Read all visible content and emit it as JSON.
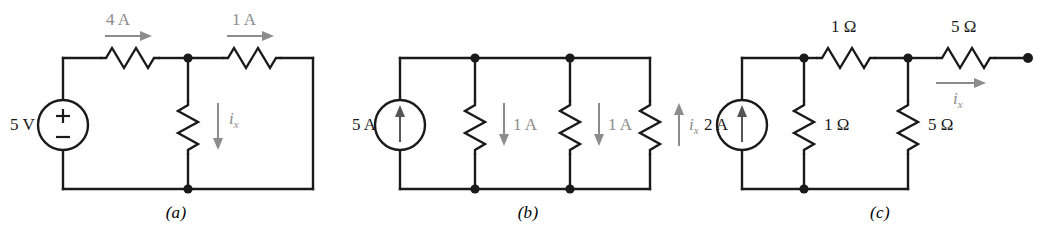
{
  "figure": {
    "background_color": "#ffffff",
    "wire_color": "#1a1a1a",
    "annotation_color": "#8c8c8c",
    "text_color": "#1a1a1a"
  },
  "panels": [
    {
      "caption": "(a)",
      "source": {
        "type": "voltage-source",
        "label": "5 V",
        "plus_sign": "+",
        "minus_sign": "−"
      },
      "resistors": [
        {
          "name": "top-left-resistor",
          "orientation": "horizontal",
          "label": ""
        },
        {
          "name": "top-right-resistor",
          "orientation": "horizontal",
          "label": ""
        },
        {
          "name": "middle-vertical-resistor",
          "orientation": "vertical",
          "label": ""
        }
      ],
      "current_annotations": [
        {
          "name": "current-4a",
          "text": "4 A",
          "direction": "right"
        },
        {
          "name": "current-1a",
          "text": "1 A",
          "direction": "right"
        },
        {
          "name": "current-ix",
          "text": "i",
          "subscript": "x",
          "direction": "down"
        }
      ]
    },
    {
      "caption": "(b)",
      "source": {
        "type": "current-source",
        "label": "5 A",
        "direction": "up"
      },
      "resistors": [
        {
          "name": "left-vertical-resistor",
          "orientation": "vertical",
          "label": ""
        },
        {
          "name": "middle-vertical-resistor",
          "orientation": "vertical",
          "label": ""
        },
        {
          "name": "right-vertical-resistor",
          "orientation": "vertical",
          "label": ""
        }
      ],
      "current_annotations": [
        {
          "name": "current-1a-left",
          "text": "1 A",
          "direction": "down"
        },
        {
          "name": "current-1a-right",
          "text": "1 A",
          "direction": "down"
        },
        {
          "name": "current-ix",
          "text": "i",
          "subscript": "x",
          "direction": "up"
        }
      ]
    },
    {
      "caption": "(c)",
      "source": {
        "type": "current-source",
        "label": "2 A",
        "direction": "up"
      },
      "resistors": [
        {
          "name": "top-1ohm-resistor",
          "orientation": "horizontal",
          "label": "1 Ω"
        },
        {
          "name": "top-5ohm-resistor",
          "orientation": "horizontal",
          "label": "5 Ω"
        },
        {
          "name": "vertical-1ohm-resistor",
          "orientation": "vertical",
          "label": "1 Ω"
        },
        {
          "name": "vertical-5ohm-resistor",
          "orientation": "vertical",
          "label": "5 Ω"
        }
      ],
      "current_annotations": [
        {
          "name": "current-ix",
          "text": "i",
          "subscript": "x",
          "direction": "right"
        }
      ],
      "open_terminal": true
    }
  ]
}
